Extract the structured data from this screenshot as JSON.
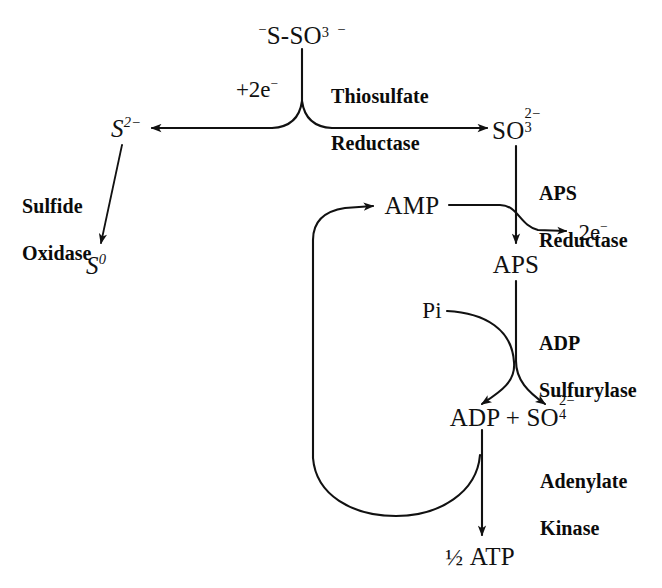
{
  "figure": {
    "kind": "biochemical-pathway-diagram",
    "topic": "Thiosulfate and sulfite oxidation / APS reductase pathway",
    "background_color": "#ffffff",
    "line_color": "#111111",
    "text_color": "#111111"
  },
  "metabolites": {
    "thiosulfate": {
      "id": "thiosulfate",
      "text": "⁻S-SO₃⁻",
      "x": 302,
      "y": 33
    },
    "sulfide": {
      "id": "sulfide",
      "text": "S²⁻",
      "x": 126,
      "y": 128
    },
    "sulfur": {
      "id": "sulfur",
      "text": "S⁰",
      "x": 96,
      "y": 265
    },
    "sulfite": {
      "id": "sulfite",
      "text": "SO₃²⁻",
      "x": 516,
      "y": 128
    },
    "amp": {
      "id": "amp",
      "text": "AMP",
      "x": 412,
      "y": 205
    },
    "aps": {
      "id": "aps",
      "text": "APS",
      "x": 516,
      "y": 264
    },
    "pi": {
      "id": "pi",
      "text": "Pi",
      "x": 432,
      "y": 310
    },
    "electrons_out": {
      "id": "electrons-out",
      "text": "2e⁻",
      "x": 593,
      "y": 232
    },
    "electrons_in": {
      "id": "electrons-in",
      "text": "+2e⁻",
      "x": 257,
      "y": 89
    },
    "adp_sulfate": {
      "id": "adp-sulfate",
      "text": "ADP + SO₄²⁻",
      "x": 512,
      "y": 415
    },
    "atp": {
      "id": "atp",
      "text": "½ ATP",
      "x": 480,
      "y": 557
    }
  },
  "enzymes": [
    {
      "id": "thiosulfate-reductase",
      "line1": "Thiosulfate",
      "line2": "Reductase",
      "x": 331,
      "y": 62
    },
    {
      "id": "sulfide-oxidase",
      "line1": "Sulfide",
      "line2": "Oxidase",
      "x": 22,
      "y": 172
    },
    {
      "id": "aps-reductase",
      "line1": "APS",
      "line2": "Reductase",
      "x": 539,
      "y": 159
    },
    {
      "id": "adp-sulfurylase",
      "line1": "ADP",
      "line2": "Sulfurylase",
      "x": 539,
      "y": 309
    },
    {
      "id": "adenylate-kinase",
      "line1": "Adenylate",
      "line2": "Kinase",
      "x": 540,
      "y": 447
    }
  ],
  "reaction_steps": [
    {
      "id": "thiosulfate-split",
      "label": "Thiosulfate Reductase",
      "substrate": "⁻S-SO₃⁻",
      "cosubstrate": "+2e⁻",
      "products": [
        "S²⁻",
        "SO₃²⁻"
      ]
    },
    {
      "id": "sulfide-oxidation",
      "label": "Sulfide Oxidase",
      "substrate": "S²⁻",
      "products": [
        "S⁰"
      ]
    },
    {
      "id": "aps-reduction",
      "label": "APS Reductase",
      "substrate": "SO₃²⁻",
      "cosubstrate": "AMP",
      "products": [
        "APS",
        "2e⁻"
      ]
    },
    {
      "id": "adp-sulfurylation",
      "label": "ADP Sulfurylase",
      "substrate": "APS",
      "cosubstrate": "Pi",
      "products": [
        "ADP",
        "SO₄²⁻"
      ]
    },
    {
      "id": "adenylate-kinase-step",
      "label": "Adenylate Kinase",
      "substrate": "ADP",
      "products": [
        "½ ATP",
        "AMP"
      ]
    }
  ]
}
